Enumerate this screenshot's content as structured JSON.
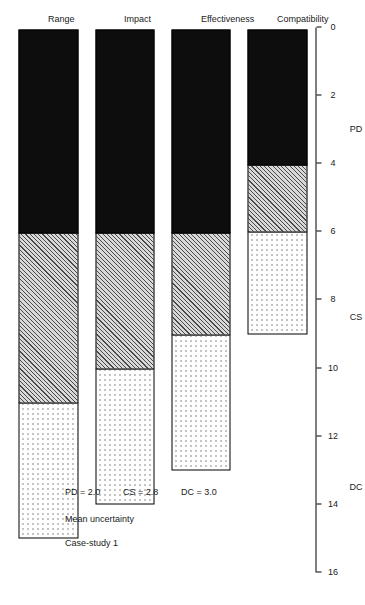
{
  "chart_data": {
    "type": "bar",
    "title": "Case-study 1",
    "subtitle": "Mean uncertainty",
    "orientation": "horizontal",
    "stacked": true,
    "xlabel": "",
    "ylabel": "",
    "categories": [
      "Range",
      "Impact",
      "Effectiveness",
      "Compatibility"
    ],
    "value_axis": {
      "min": 0,
      "max": 16,
      "ticks": [
        0,
        2,
        4,
        6,
        8,
        10,
        12,
        14,
        16
      ],
      "tick_labels": [
        "0",
        "2",
        "4",
        "6",
        "8",
        "10",
        "12",
        "14",
        "16"
      ],
      "direction": "descending-left-to-right",
      "grid": false
    },
    "band_labels": [
      {
        "label": "PD",
        "from": 0,
        "to": 6
      },
      {
        "label": "CS",
        "from": 6,
        "to": 11
      },
      {
        "label": "DC",
        "from": 11,
        "to": 16
      }
    ],
    "series": [
      {
        "name": "PD",
        "fill": "solid-black",
        "values": [
          6,
          6,
          6,
          4
        ]
      },
      {
        "name": "CS",
        "fill": "diagonal-hatch",
        "values": [
          5,
          4,
          3,
          2
        ]
      },
      {
        "name": "DC",
        "fill": "dotted",
        "values": [
          4,
          4,
          4,
          3
        ]
      }
    ],
    "totals": [
      15,
      14,
      13,
      9
    ],
    "annotations": [
      {
        "text": "PD = 2.0"
      },
      {
        "text": "CS = 2.8"
      },
      {
        "text": "DC = 3.0"
      }
    ],
    "legend": "none",
    "colors": {
      "pd": "#0d0d0d",
      "cs": "#d8d8d8",
      "dc": "#ffffff",
      "outline": "#000000",
      "text": "#1a1a1a"
    }
  },
  "labels": {
    "tick_0": "0",
    "tick_2": "2",
    "tick_4": "4",
    "tick_6": "6",
    "tick_8": "8",
    "tick_10": "10",
    "tick_12": "12",
    "tick_14": "14",
    "tick_16": "16",
    "band_pd": "PD",
    "band_cs": "CS",
    "band_dc": "DC",
    "cat_range": "Range",
    "cat_impact": "Impact",
    "cat_effectiveness": "Effectiveness",
    "cat_compatibility": "Compatibility",
    "title": "Case-study 1",
    "subtitle": "Mean uncertainty",
    "annot_pd": "PD = 2.0",
    "annot_cs": "CS = 2.8",
    "annot_dc": "DC = 3.0"
  }
}
